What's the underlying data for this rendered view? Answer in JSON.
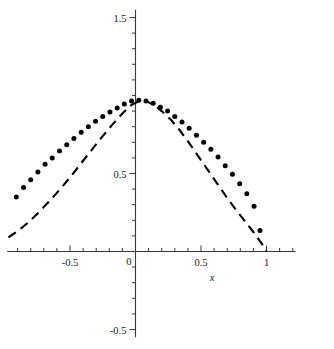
{
  "chart_data": {
    "type": "scatter",
    "title": "",
    "xlabel": "x",
    "ylabel": "",
    "grid": false,
    "legend": "none",
    "xlim": [
      -0.98,
      1.22
    ],
    "ylim": [
      -0.55,
      1.55
    ],
    "x_ticks": [
      -0.5,
      0,
      0.5,
      1
    ],
    "x_tick_labels": [
      "-0.5",
      "0",
      "0.5",
      "1"
    ],
    "x_minor_tick_step": 0.1,
    "y_ticks": [
      -0.5,
      0,
      0.5,
      1.5
    ],
    "y_tick_labels": [
      "-0.5",
      "0",
      "0.5",
      "1.5"
    ],
    "y_minor_tick_step": 0.1,
    "series": [
      {
        "name": "dotted-series",
        "style": "dotted",
        "marker": "circle",
        "color": "#000000",
        "points": [
          [
            -0.91,
            0.35
          ],
          [
            -0.855,
            0.41
          ],
          [
            -0.8,
            0.46
          ],
          [
            -0.745,
            0.51
          ],
          [
            -0.69,
            0.56
          ],
          [
            -0.635,
            0.6
          ],
          [
            -0.58,
            0.645
          ],
          [
            -0.525,
            0.685
          ],
          [
            -0.47,
            0.725
          ],
          [
            -0.415,
            0.765
          ],
          [
            -0.36,
            0.8
          ],
          [
            -0.305,
            0.835
          ],
          [
            -0.25,
            0.865
          ],
          [
            -0.195,
            0.895
          ],
          [
            -0.14,
            0.92
          ],
          [
            -0.085,
            0.945
          ],
          [
            -0.03,
            0.965
          ],
          [
            0.025,
            0.97
          ],
          [
            0.08,
            0.965
          ],
          [
            0.135,
            0.95
          ],
          [
            0.19,
            0.925
          ],
          [
            0.245,
            0.9
          ],
          [
            0.3,
            0.865
          ],
          [
            0.355,
            0.83
          ],
          [
            0.41,
            0.79
          ],
          [
            0.465,
            0.745
          ],
          [
            0.52,
            0.7
          ],
          [
            0.575,
            0.655
          ],
          [
            0.63,
            0.605
          ],
          [
            0.685,
            0.55
          ],
          [
            0.74,
            0.495
          ],
          [
            0.795,
            0.435
          ],
          [
            0.85,
            0.37
          ],
          [
            0.905,
            0.29
          ],
          [
            0.95,
            0.135
          ]
        ]
      },
      {
        "name": "dashed-series",
        "style": "dashed",
        "color": "#000000",
        "points": [
          [
            -0.97,
            0.09
          ],
          [
            -0.9,
            0.13
          ],
          [
            -0.82,
            0.185
          ],
          [
            -0.74,
            0.25
          ],
          [
            -0.66,
            0.32
          ],
          [
            -0.58,
            0.395
          ],
          [
            -0.5,
            0.475
          ],
          [
            -0.42,
            0.56
          ],
          [
            -0.34,
            0.645
          ],
          [
            -0.26,
            0.73
          ],
          [
            -0.18,
            0.81
          ],
          [
            -0.1,
            0.885
          ],
          [
            -0.03,
            0.94
          ],
          [
            0.03,
            0.965
          ],
          [
            0.08,
            0.965
          ],
          [
            0.14,
            0.94
          ],
          [
            0.2,
            0.9
          ],
          [
            0.27,
            0.845
          ],
          [
            0.34,
            0.775
          ],
          [
            0.41,
            0.695
          ],
          [
            0.48,
            0.61
          ],
          [
            0.55,
            0.525
          ],
          [
            0.62,
            0.44
          ],
          [
            0.69,
            0.355
          ],
          [
            0.76,
            0.275
          ],
          [
            0.83,
            0.2
          ],
          [
            0.9,
            0.125
          ],
          [
            0.96,
            0.055
          ],
          [
            1.0,
            0.0
          ]
        ]
      }
    ]
  },
  "axes": {
    "x_label": "x",
    "y_top_label": "1.5",
    "y_mid_label": "0.5",
    "y_bottom_label": "-0.5",
    "x_labels": [
      "-0.5",
      "0",
      "0.5",
      "1"
    ]
  },
  "colors": {
    "axis": "#3a3a3a",
    "data": "#000000",
    "background": "#ffffff"
  }
}
